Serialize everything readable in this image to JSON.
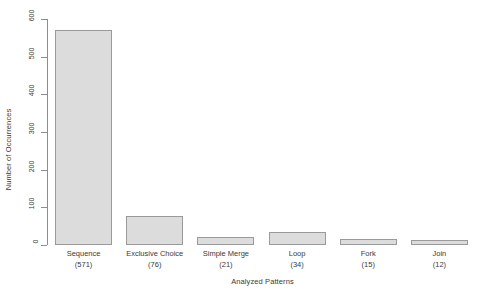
{
  "chart_data": {
    "type": "bar",
    "title": "",
    "xlabel": "Analyzed Patterns",
    "ylabel": "Number of Occurrences",
    "categories": [
      "Sequence",
      "Exclusive Choice",
      "Simple Merge",
      "Loop",
      "Fork",
      "Join"
    ],
    "values": [
      571,
      76,
      21,
      34,
      15,
      12
    ],
    "value_labels": [
      "(571)",
      "(76)",
      "(21)",
      "(34)",
      "(15)",
      "(12)"
    ],
    "ylim": [
      0,
      600
    ],
    "yticks": [
      0,
      100,
      200,
      300,
      400,
      500,
      600
    ],
    "ytick_labels": [
      "0",
      "100",
      "200",
      "300",
      "400",
      "500",
      "600"
    ],
    "grid": false,
    "legend": false,
    "bar_fill": "#dcdcdc",
    "bar_border": "#9a9a9a",
    "axis_color": "#8d8d8d",
    "text_color": "#3a3a3a"
  }
}
